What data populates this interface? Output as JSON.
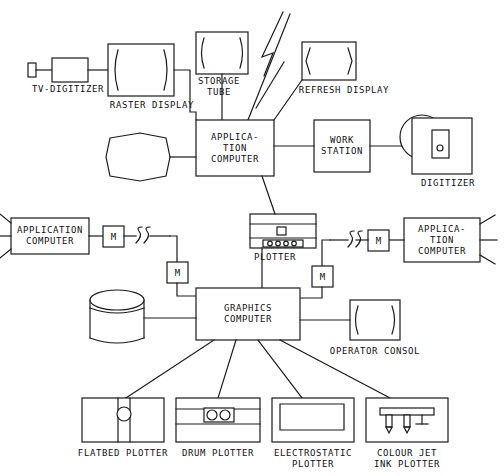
{
  "diagram": {
    "stroke_color": "#1a1a1a",
    "background_color": "#ffffff"
  },
  "nodes": {
    "tv_digitizer": {
      "label": "TV-DIGITIZER",
      "type": "tv-camera"
    },
    "raster_display": {
      "label": "RASTER DISPLAY",
      "type": "crt-display"
    },
    "storage_tube": {
      "label": "STORAGE\nTUBE",
      "type": "crt-display"
    },
    "refresh_display": {
      "label": "REFRESH DISPLAY",
      "type": "crt-display"
    },
    "application_computer_center": {
      "label": "APPLICA-\nTION\nCOMPUTER",
      "type": "computer-box"
    },
    "work_station": {
      "label": "WORK\nSTATION",
      "type": "computer-box"
    },
    "digitizer": {
      "label": "DIGITIZER",
      "type": "digitizer-tablet"
    },
    "disk_top": {
      "label": "",
      "type": "drum-storage"
    },
    "application_computer_left": {
      "label": "APPLICATION\nCOMPUTER",
      "type": "computer-box"
    },
    "application_computer_right": {
      "label": "APPLICA-\nTION\nCOMPUTER",
      "type": "computer-box"
    },
    "plotter": {
      "label": "PLOTTER",
      "type": "bed-plotter"
    },
    "graphics_computer": {
      "label": "GRAPHICS\nCOMPUTER",
      "type": "computer-box"
    },
    "disk_left": {
      "label": "",
      "type": "disk-cylinder"
    },
    "operator_consol": {
      "label": "OPERATOR CONSOL",
      "type": "crt-display"
    },
    "flatbed_plotter": {
      "label": "FLATBED PLOTTER",
      "type": "flatbed-plotter"
    },
    "drum_plotter": {
      "label": "DRUM PLOTTER",
      "type": "drum-plotter"
    },
    "electrostatic_plotter": {
      "label": "ELECTROSTATIC\nPLOTTER",
      "type": "electrostatic-plotter"
    },
    "colour_jet_ink_plotter": {
      "label": "COLOUR JET\nINK PLOTTER",
      "type": "jet-plotter"
    }
  },
  "modems": {
    "label": "M",
    "items": [
      {
        "name": "modem-left-upper"
      },
      {
        "name": "modem-left-lower"
      },
      {
        "name": "modem-right-lower"
      },
      {
        "name": "modem-right-upper"
      }
    ]
  },
  "links": {
    "wireless_symbol": "lightning-bolt",
    "line_break_symbol": "squiggle"
  }
}
